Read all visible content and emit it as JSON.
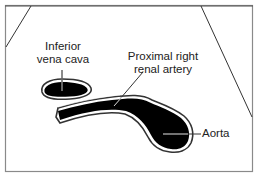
{
  "diagram": {
    "type": "anatomical-illustration",
    "labels": {
      "ivc_line1": "Inferior",
      "ivc_line2": "vena cava",
      "rra_line1": "Proximal right",
      "rra_line2": "renal artery",
      "aorta": "Aorta"
    },
    "structures": [
      {
        "name": "Inferior vena cava",
        "fill": "#000000"
      },
      {
        "name": "Proximal right renal artery",
        "fill": "#000000"
      },
      {
        "name": "Aorta",
        "fill": "#000000"
      }
    ],
    "colors": {
      "frame": "#888888",
      "structure_fill": "#000000",
      "outline": "#333333",
      "text": "#222222",
      "background": "#ffffff"
    }
  }
}
